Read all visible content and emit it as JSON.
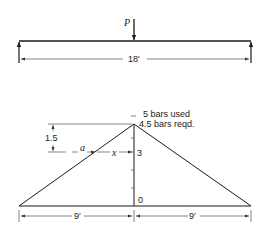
{
  "beam": {
    "load_label": "P",
    "span_label": "18′"
  },
  "moment_diagram": {
    "top_label_used": "5   bars used",
    "top_label_reqd": "4.5 bars reqd.",
    "tick_3_label": "3",
    "tick_0_label": "0",
    "height_dim_label": "1.5",
    "a_label": "a",
    "x_label": "x",
    "left_span_label": "9′",
    "right_span_label": "9′"
  }
}
